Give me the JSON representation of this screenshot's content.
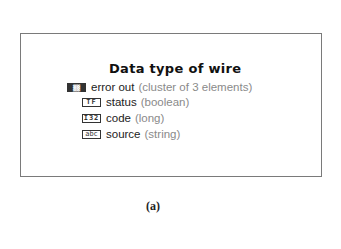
{
  "panel": {
    "title": "Data type of wire",
    "root": {
      "icon": "cluster-icon",
      "icon_text": "▒▒",
      "name": "error out",
      "type": "(cluster of 3 elements)"
    },
    "elements": [
      {
        "icon": "boolean-icon",
        "icon_text": "TF",
        "name": "status",
        "type": "(boolean)"
      },
      {
        "icon": "i32-icon",
        "icon_text": "I32",
        "name": "code",
        "type": "(long)"
      },
      {
        "icon": "string-icon",
        "icon_text": "abc",
        "name": "source",
        "type": "(string)"
      }
    ]
  },
  "caption": "(a)",
  "colors": {
    "border": "#7a7a7a",
    "type_text": "#8a8a8a",
    "text": "#222222"
  }
}
